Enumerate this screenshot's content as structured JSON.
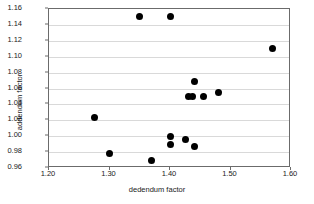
{
  "chart_data": {
    "type": "scatter",
    "title": "",
    "xlabel": "dedendum factor",
    "ylabel": "addendum factor",
    "xlim": [
      1.2,
      1.6
    ],
    "ylim": [
      0.96,
      1.16
    ],
    "xticks": [
      "1.20",
      "1.30",
      "1.40",
      "1.50",
      "1.60"
    ],
    "xtick_values": [
      1.2,
      1.3,
      1.4,
      1.5,
      1.6
    ],
    "yticks": [
      "0.96",
      "0.98",
      "1.00",
      "1.02",
      "1.04",
      "1.06",
      "1.08",
      "1.10",
      "1.12",
      "1.14",
      "1.16"
    ],
    "ytick_values": [
      0.96,
      0.98,
      1.0,
      1.02,
      1.04,
      1.06,
      1.08,
      1.1,
      1.12,
      1.14,
      1.16
    ],
    "grid": "horizontal",
    "legend": "none",
    "marker": "filled-circle",
    "marker_color": "#000000",
    "points": [
      {
        "x": 1.275,
        "y": 1.024
      },
      {
        "x": 1.3,
        "y": 0.978
      },
      {
        "x": 1.35,
        "y": 1.15
      },
      {
        "x": 1.37,
        "y": 0.97
      },
      {
        "x": 1.4,
        "y": 1.15
      },
      {
        "x": 1.4,
        "y": 1.0
      },
      {
        "x": 1.4,
        "y": 0.99
      },
      {
        "x": 1.425,
        "y": 0.996
      },
      {
        "x": 1.43,
        "y": 1.05
      },
      {
        "x": 1.437,
        "y": 1.05
      },
      {
        "x": 1.44,
        "y": 1.069
      },
      {
        "x": 1.44,
        "y": 0.987
      },
      {
        "x": 1.455,
        "y": 1.05
      },
      {
        "x": 1.48,
        "y": 1.055
      },
      {
        "x": 1.57,
        "y": 1.11
      }
    ]
  }
}
